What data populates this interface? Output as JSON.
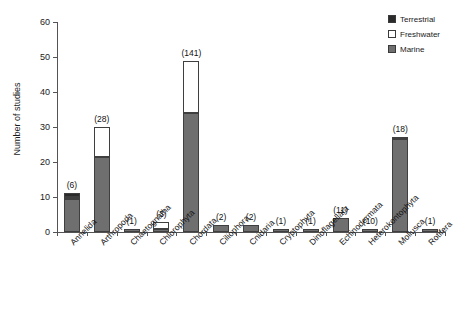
{
  "chart_data": {
    "type": "bar",
    "stacked": true,
    "title": "",
    "xlabel": "",
    "ylabel": "Number of studies",
    "ylim": [
      0,
      60
    ],
    "yticks": [
      0,
      10,
      20,
      30,
      40,
      50,
      60
    ],
    "grid": false,
    "legend_position": "top-right",
    "legend": [
      "Terrestrial",
      "Freshwater",
      "Marine"
    ],
    "categories": [
      "Annelida",
      "Arthropoda",
      "Chaetognatha",
      "Chlorophyta",
      "Chordata",
      "Ciliophora",
      "Cnidaria",
      "Cryptophyta",
      "Dinoflagellata",
      "Echinodermata",
      "Heterokontophyta",
      "Mollusca",
      "Rotifera"
    ],
    "series": [
      {
        "name": "Marine",
        "color": "#6f6f6f",
        "values": [
          9.5,
          21.5,
          1,
          1,
          34,
          2,
          2,
          1,
          1,
          4,
          1,
          26.5,
          1
        ]
      },
      {
        "name": "Freshwater",
        "color": "#ffffff",
        "values": [
          0.6,
          8.5,
          0,
          2,
          15,
          0,
          0,
          0,
          0,
          0,
          0,
          0.7,
          0
        ]
      },
      {
        "name": "Terrestrial",
        "color": "#2b2b2b",
        "values": [
          1,
          0,
          0,
          0,
          0,
          0,
          0,
          0,
          0,
          0,
          0,
          0,
          0
        ]
      }
    ],
    "bar_totals": [
      11.1,
      30,
      1,
      3,
      49,
      2,
      2,
      1,
      1,
      4,
      1,
      27.2,
      1
    ],
    "annotations": {
      "label": "counts in parentheses above each bar",
      "values": [
        "(6)",
        "(28)",
        "(1)",
        "(3)",
        "(141)",
        "(2)",
        "(2)",
        "(1)",
        "(1)",
        "(11)",
        "(10)",
        "(18)",
        "(1)"
      ]
    }
  },
  "colors": {
    "terrestrial": "#2b2b2b",
    "freshwater": "#ffffff",
    "marine": "#6f6f6f",
    "axis": "#545454",
    "text": "#1a1a1a"
  }
}
